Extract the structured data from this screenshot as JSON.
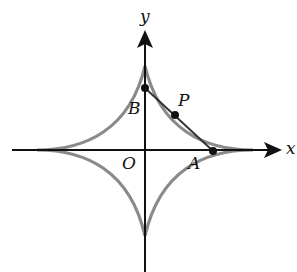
{
  "diagram": {
    "type": "astroid",
    "labels": {
      "y_axis": "y",
      "x_axis": "x",
      "origin": "O",
      "point_a": "A",
      "point_b": "B",
      "point_p": "P"
    },
    "colors": {
      "curve": "#8a8a8a",
      "axis": "#111111",
      "segment": "#333333",
      "point": "#111111"
    }
  }
}
